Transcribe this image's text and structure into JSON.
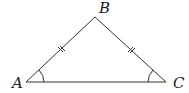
{
  "diagram": {
    "type": "isosceles-triangle",
    "vertices": [
      {
        "label": "A",
        "x": 26,
        "y": 82
      },
      {
        "label": "B",
        "x": 95,
        "y": 17
      },
      {
        "label": "C",
        "x": 166,
        "y": 82
      }
    ],
    "equal_sides": [
      "AB",
      "BC"
    ],
    "marked_angles": [
      "A",
      "C"
    ],
    "stroke_color": "#333333"
  }
}
